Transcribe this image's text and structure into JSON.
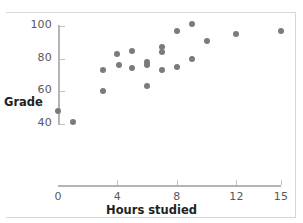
{
  "chart_data": {
    "type": "scatter",
    "title": "",
    "xlabel": "Hours studied",
    "ylabel": "Grade",
    "xlim": [
      0,
      15.8
    ],
    "ylim": [
      36,
      103
    ],
    "grid": false,
    "legend": null,
    "xticks": [
      0,
      4,
      8,
      12,
      15
    ],
    "xtick_labels": [
      "0",
      "4",
      "8",
      "12",
      "15"
    ],
    "yticks": [
      40,
      60,
      80,
      100
    ],
    "ytick_labels": [
      "40",
      "60",
      "80",
      "100"
    ],
    "marker_color": "#7b7b7b",
    "axis_color": "#b4b4b4",
    "points": [
      {
        "x": 0.0,
        "y": 48
      },
      {
        "x": 1.0,
        "y": 41
      },
      {
        "x": 3.0,
        "y": 73
      },
      {
        "x": 3.0,
        "y": 60
      },
      {
        "x": 4.0,
        "y": 83
      },
      {
        "x": 4.1,
        "y": 76
      },
      {
        "x": 5.0,
        "y": 85
      },
      {
        "x": 5.0,
        "y": 74
      },
      {
        "x": 6.0,
        "y": 78
      },
      {
        "x": 6.0,
        "y": 76
      },
      {
        "x": 6.0,
        "y": 63
      },
      {
        "x": 7.0,
        "y": 87
      },
      {
        "x": 7.0,
        "y": 84
      },
      {
        "x": 7.0,
        "y": 73
      },
      {
        "x": 8.0,
        "y": 97
      },
      {
        "x": 8.0,
        "y": 75
      },
      {
        "x": 9.0,
        "y": 101
      },
      {
        "x": 9.0,
        "y": 80
      },
      {
        "x": 10.0,
        "y": 91
      },
      {
        "x": 12.0,
        "y": 95
      },
      {
        "x": 15.0,
        "y": 97
      }
    ]
  },
  "axes": {
    "y_title": "Grade",
    "x_title": "Hours studied"
  }
}
